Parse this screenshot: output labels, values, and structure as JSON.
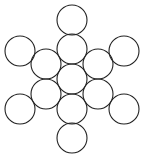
{
  "diagram": {
    "title": "",
    "canvas": {
      "width": 143,
      "height": 159,
      "background": "#ffffff"
    },
    "stroke_color": "#222222",
    "radius": 15,
    "circles": [
      {
        "id": "center",
        "cx": 72,
        "cy": 79
      },
      {
        "id": "inner-top",
        "cx": 72,
        "cy": 49
      },
      {
        "id": "inner-bottom",
        "cx": 72,
        "cy": 109
      },
      {
        "id": "inner-upper-left",
        "cx": 46,
        "cy": 64
      },
      {
        "id": "inner-upper-right",
        "cx": 98,
        "cy": 64
      },
      {
        "id": "inner-lower-left",
        "cx": 46,
        "cy": 94
      },
      {
        "id": "inner-lower-right",
        "cx": 98,
        "cy": 94
      },
      {
        "id": "outer-top",
        "cx": 72,
        "cy": 20
      },
      {
        "id": "outer-bottom",
        "cx": 72,
        "cy": 138
      },
      {
        "id": "outer-upper-left",
        "cx": 20,
        "cy": 51
      },
      {
        "id": "outer-upper-right",
        "cx": 124,
        "cy": 51
      },
      {
        "id": "outer-lower-left",
        "cx": 20,
        "cy": 109
      },
      {
        "id": "outer-lower-right",
        "cx": 124,
        "cy": 109
      }
    ]
  }
}
